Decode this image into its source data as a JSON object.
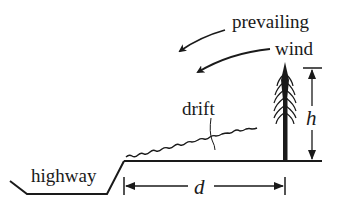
{
  "diagram": {
    "labels": {
      "wind_line1": "prevailing",
      "wind_line2": "wind",
      "drift": "drift",
      "highway": "highway",
      "height_var": "h",
      "distance_var": "d"
    },
    "colors": {
      "ink": "#1a1a1a",
      "background": "#ffffff"
    },
    "elements": [
      "highway-cut profile",
      "ground line",
      "snow drift surface",
      "conifer tree",
      "height dimension h",
      "distance dimension d",
      "two prevailing wind arrows"
    ]
  }
}
